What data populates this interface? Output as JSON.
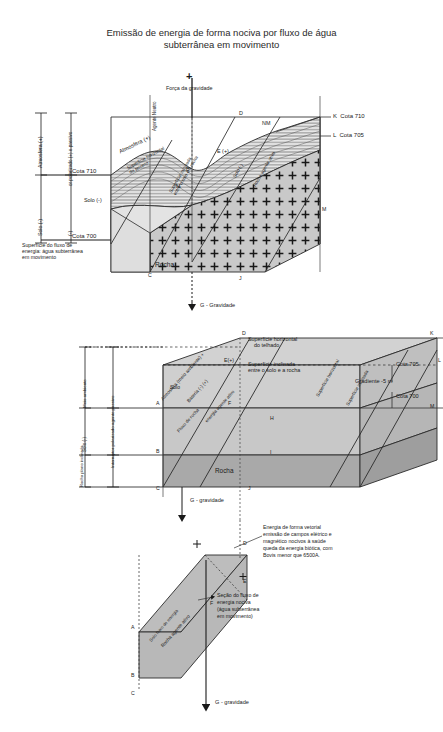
{
  "title": {
    "line1": "Emissão de energia de forma nociva por fluxo de água",
    "line2": "subterrânea em movimento"
  },
  "colors": {
    "ink": "#1a1a1a",
    "soil_fill": "#d9d9d9",
    "rock_fill": "#bdbdbd",
    "rock_top": "#cfcfcf",
    "panel_fill": "#c8c8c8",
    "hatch": "#555555",
    "white": "#ffffff"
  },
  "figure1": {
    "name": "Bloco 3D - superfície do terreno, solo e rocha",
    "gravity_plus": "+",
    "gravity_force": "Força da gravidade",
    "agente_neutro": "Agente\nNeutro",
    "atmosfera_label": "Atmosfera (+)",
    "superficie_horizontal": "Superfície horizontal\ndo terreno",
    "solo_label": "Solo (-)",
    "rocha_label": "Rocha",
    "e_label": "E (+)",
    "nm_label": "NM",
    "agente_ativo": "Rocha agente ativo",
    "solo_passivo": "Solo (-)",
    "superficie_inclinada": "Superfície inclinada\nentre o solo e a rocha",
    "gravidade": "G - Gravidade",
    "vertices": [
      "A",
      "B",
      "C",
      "D",
      "E",
      "F",
      "J",
      "K",
      "L",
      "M"
    ],
    "cota_k": "K  Cota 710",
    "cota_l": "L  Cota 705",
    "left_axis": {
      "atmosfera_pos": "Atmosfera (+)",
      "solo_neg": "Solo (-)",
      "polarizado": "or polarizado (+)\ne passivo",
      "neg": "(-)",
      "cota710": "Cota 710",
      "cota700": "Cota 700"
    },
    "note": "Superfície do fluxo de\nenergia: água subterrânea\nem movimento"
  },
  "figure2": {
    "name": "Bloco 3D esquemático - gradiente",
    "superficie_telhado": "Superfície horizontal\ndo telhado",
    "superficie_inclinada": "Superfície inclinada\nentre o solo e a rocha",
    "cota705": "Cota 705",
    "cota700": "Cota 700",
    "gradiente": "Gradiente -5 m",
    "e_label": "E(+)",
    "atmosfera": "Atmosfera (meio ambiente) +",
    "bateria": "Bateria (-) (+)",
    "fluxo_rocha": "Fluxo de\nrocha",
    "energia_agente": "energia\nagente ativo",
    "solo": "Solo",
    "rocha": "Rocha",
    "superficie_horiz2": "Superfície horizontal",
    "superficie_inclin2": "Superfície inclinada",
    "gravidade": "G - gravidade",
    "vertices": [
      "A",
      "B",
      "C",
      "D",
      "E",
      "F",
      "H",
      "J",
      "K",
      "L",
      "M",
      "I"
    ],
    "left_axis": {
      "meio_ambiente": "Meio ambiente",
      "solo_neg": "Solo\n(-)",
      "rocha_plano": "Rocha\nplano\ninclinado",
      "interruptor": "Interruptor polarizado\nagente passivo"
    }
  },
  "figure3": {
    "name": "Seção do fluxo de energia nociva",
    "callout_energia": "Energia de forma vetorial\nemissão de campos elétrico e\nmagnético nocivos à saúde\nqueda da energia biótica, com\nBovis menor que 6500A.",
    "callout_secao": "Seção do fluxo de\nenergia nociva\n(água subterrânea\nem movimento)",
    "rocha_agente": "Rocha agente ativo",
    "solo": "Solo\nfluxo de\nenergia",
    "gravidade": "G - gravidade",
    "plus": "+",
    "vertices": [
      "A",
      "B",
      "C",
      "D",
      "E",
      "F"
    ]
  }
}
